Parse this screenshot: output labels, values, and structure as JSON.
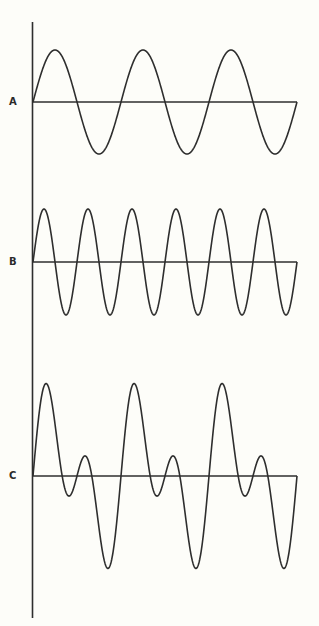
{
  "diagram": {
    "title": "",
    "background": "#fdfdf9",
    "line_color": "#2e2e2e",
    "axis": {
      "x": 32.5,
      "y_top": 22,
      "y_bottom": 618
    },
    "x_start": 33,
    "x_end": 297,
    "waves": [
      {
        "id": "A",
        "label": "A",
        "label_x": 9,
        "label_y": 97,
        "baseline_y": 102,
        "cycles": 3,
        "components": [
          {
            "harmonic": 1,
            "amplitude": 52
          }
        ],
        "description": "Sine wave, 3 cycles"
      },
      {
        "id": "B",
        "label": "B",
        "label_x": 9,
        "label_y": 257,
        "baseline_y": 262,
        "cycles": 3,
        "components": [
          {
            "harmonic": 2,
            "amplitude": 53
          }
        ],
        "description": "Sine wave at double frequency, 6 cycles"
      },
      {
        "id": "C",
        "label": "C",
        "label_x": 9,
        "label_y": 471,
        "baseline_y": 476,
        "cycles": 3,
        "components": [
          {
            "harmonic": 1,
            "amplitude": 52
          },
          {
            "harmonic": 2,
            "amplitude": 53
          }
        ],
        "description": "Complex wave: sum of A and B"
      }
    ]
  }
}
